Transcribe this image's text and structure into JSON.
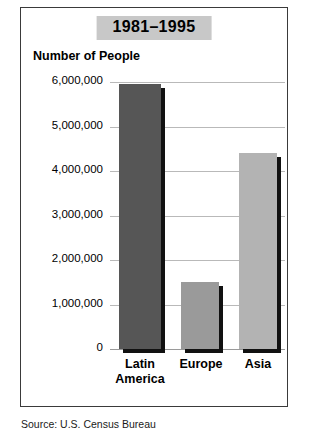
{
  "chart_data": {
    "type": "bar",
    "title": "1981–1995",
    "ylabel": "Number of People",
    "xlabel": "",
    "categories": [
      "Latin America",
      "Europe",
      "Asia"
    ],
    "values": [
      5950000,
      1500000,
      4400000
    ],
    "bar_colors": [
      "#565656",
      "#9a9a9a",
      "#b3b3b3"
    ],
    "shadow_color": "#111111",
    "ylim": [
      0,
      6000000
    ],
    "ytick_labels": [
      "6,000,000",
      "5,000,000",
      "4,000,000",
      "3,000,000",
      "2,000,000",
      "1,000,000",
      "0"
    ],
    "ytick_values": [
      6000000,
      5000000,
      4000000,
      3000000,
      2000000,
      1000000,
      0
    ],
    "grid": true,
    "legend": "none",
    "title_background": "#c8c8c8",
    "frame_color": "#3a3a3a",
    "gridline_color": "#b9b9b9"
  },
  "source": {
    "note": "Source: U.S. Census Bureau"
  }
}
